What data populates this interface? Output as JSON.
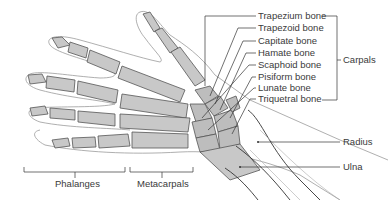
{
  "diagram": {
    "carpal_labels": [
      {
        "text": "Trapezium bone",
        "x": 258,
        "y": 17
      },
      {
        "text": "Trapezoid bone",
        "x": 258,
        "y": 29
      },
      {
        "text": "Capitate bone",
        "x": 258,
        "y": 42
      },
      {
        "text": "Hamate bone",
        "x": 258,
        "y": 54
      },
      {
        "text": "Scaphoid bone",
        "x": 258,
        "y": 66
      },
      {
        "text": "Pisiform bone",
        "x": 258,
        "y": 78
      },
      {
        "text": "Lunate bone",
        "x": 258,
        "y": 89
      },
      {
        "text": "Triquetral bone",
        "x": 258,
        "y": 100
      }
    ],
    "group_labels": {
      "carpals": "Carpals",
      "radius": "Radius",
      "ulna": "Ulna",
      "phalanges": "Phalanges",
      "metacarpals": "Metacarpals"
    },
    "colors": {
      "bone_fill": "#c8c8c8",
      "line": "#333333",
      "skin_outline": "#9a9a9a",
      "text": "#3a3a3a"
    }
  }
}
